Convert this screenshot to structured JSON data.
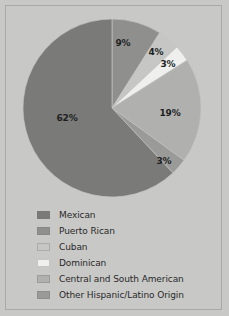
{
  "figure": {
    "background_color": "#c8c8c7",
    "border_color": "#a9a9a8",
    "label_text_color": "#201f1f",
    "legend_text_color": "#2a2929"
  },
  "chart_data": {
    "type": "pie",
    "title": "",
    "subtitle": "",
    "xlabel": "",
    "ylabel": "",
    "grid": false,
    "legend_position": "bottom-left",
    "start_angle_deg": 0,
    "direction": "clockwise",
    "center": {
      "x": 112,
      "y": 108
    },
    "radius": 89,
    "categories": [
      "Mexican",
      "Puerto Rican",
      "Cuban",
      "Dominican",
      "Central and South American",
      "Other Hispanic/Latino Origin"
    ],
    "values": [
      62,
      9,
      4,
      3,
      19,
      3
    ],
    "data_labels": [
      "62%",
      "9%",
      "4%",
      "3%",
      "19%",
      "3%"
    ],
    "colors": [
      "#7a7a79",
      "#8f8f8e",
      "#c6c6c5",
      "#efefee",
      "#b0b0af",
      "#9a9a99"
    ],
    "slices": [
      {
        "label": "Puerto Rican",
        "value": 9,
        "data_label": "9%",
        "color": "#8f8f8e",
        "label_x": 123,
        "label_y": 43
      },
      {
        "label": "Cuban",
        "value": 4,
        "data_label": "4%",
        "color": "#c6c6c5",
        "label_x": 156,
        "label_y": 52
      },
      {
        "label": "Dominican",
        "value": 3,
        "data_label": "3%",
        "color": "#efefee",
        "label_x": 168,
        "label_y": 64
      },
      {
        "label": "Central and South American",
        "value": 19,
        "data_label": "19%",
        "color": "#b0b0af",
        "label_x": 170,
        "label_y": 113
      },
      {
        "label": "Other Hispanic/Latino Origin",
        "value": 3,
        "data_label": "3%",
        "color": "#9a9a99",
        "label_x": 164,
        "label_y": 161
      },
      {
        "label": "Mexican",
        "value": 62,
        "data_label": "62%",
        "color": "#7a7a79",
        "label_x": 67,
        "label_y": 118
      }
    ]
  },
  "legend": {
    "items": [
      {
        "label": "Mexican",
        "color": "#7a7a79"
      },
      {
        "label": "Puerto Rican",
        "color": "#8f8f8e"
      },
      {
        "label": "Cuban",
        "color": "#c6c6c5"
      },
      {
        "label": "Dominican",
        "color": "#efefee"
      },
      {
        "label": "Central and South American",
        "color": "#b0b0af"
      },
      {
        "label": "Other Hispanic/Latino Origin",
        "color": "#9a9a99"
      }
    ]
  }
}
